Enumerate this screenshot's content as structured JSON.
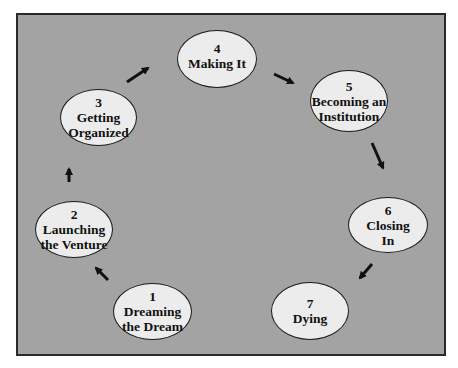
{
  "diagram": {
    "type": "cycle",
    "colors": {
      "background": "#a3a3a3",
      "frame_border": "#2a2a2a",
      "node_fill": "#ececec",
      "node_border": "#1a1a1a",
      "arrow": "#111111",
      "text": "#111111"
    },
    "stages": [
      {
        "number": "1",
        "line1": "Dreaming",
        "line2": "the Dream"
      },
      {
        "number": "2",
        "line1": "Launching",
        "line2": "the Venture"
      },
      {
        "number": "3",
        "line1": "Getting",
        "line2": "Organized"
      },
      {
        "number": "4",
        "line1": "Making It",
        "line2": ""
      },
      {
        "number": "5",
        "line1": "Becoming an",
        "line2": "Institution"
      },
      {
        "number": "6",
        "line1": "Closing",
        "line2": "In"
      },
      {
        "number": "7",
        "line1": "Dying",
        "line2": ""
      }
    ],
    "arrows": [
      {
        "from": "1",
        "to": "2"
      },
      {
        "from": "2",
        "to": "3"
      },
      {
        "from": "3",
        "to": "4"
      },
      {
        "from": "4",
        "to": "5"
      },
      {
        "from": "5",
        "to": "6"
      },
      {
        "from": "6",
        "to": "7"
      }
    ]
  }
}
